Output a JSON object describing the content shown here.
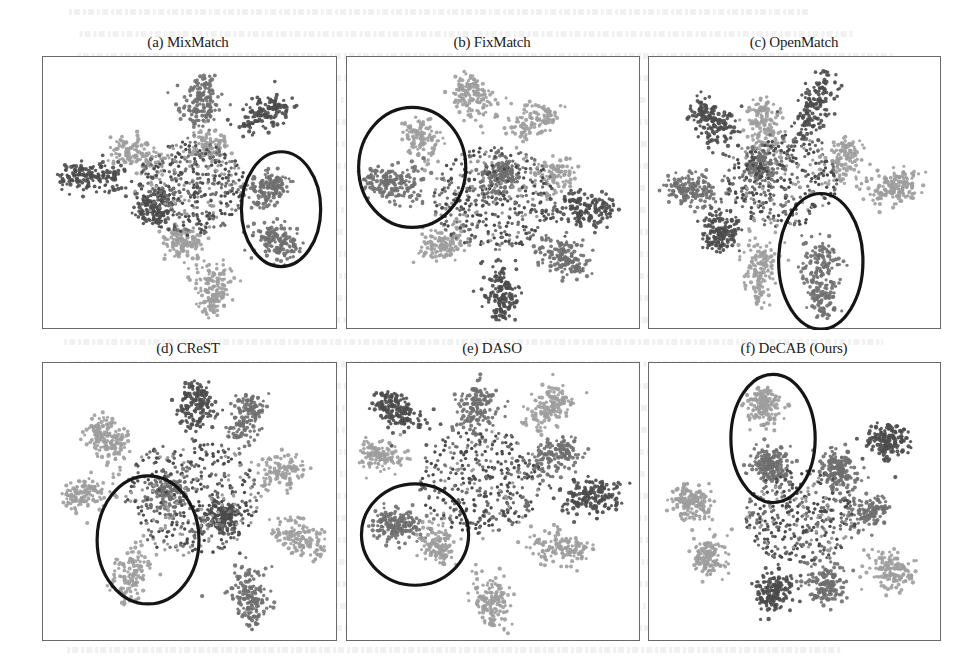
{
  "chart_data": [
    {
      "type": "scatter",
      "title": "(a) MixMatch",
      "xlabel": "",
      "ylabel": "",
      "grid": false,
      "legend": "none",
      "xlim": [
        0,
        1
      ],
      "ylim": [
        0,
        1
      ],
      "clusters": [
        {
          "tone": "dark",
          "arm": [
            0.05,
            0.43
          ],
          "center": [
            0.25,
            0.44
          ],
          "n": 160
        },
        {
          "tone": "mid",
          "arm": [
            0.55,
            0.08
          ],
          "center": [
            0.52,
            0.22
          ],
          "n": 150
        },
        {
          "tone": "dark",
          "arm": [
            0.82,
            0.17
          ],
          "center": [
            0.7,
            0.22
          ],
          "n": 130
        },
        {
          "tone": "light",
          "arm": [
            0.25,
            0.33
          ],
          "center": [
            0.38,
            0.38
          ],
          "n": 130
        },
        {
          "tone": "light",
          "arm": [
            0.58,
            0.3
          ],
          "center": [
            0.55,
            0.35
          ],
          "n": 110
        },
        {
          "tone": "mid",
          "arm": [
            0.8,
            0.46
          ],
          "center": [
            0.75,
            0.5
          ],
          "n": 150
        },
        {
          "tone": "mid",
          "arm": [
            0.85,
            0.7
          ],
          "center": [
            0.76,
            0.66
          ],
          "n": 140
        },
        {
          "tone": "light",
          "arm": [
            0.58,
            0.93
          ],
          "center": [
            0.58,
            0.8
          ],
          "n": 150
        },
        {
          "tone": "light",
          "arm": [
            0.45,
            0.67
          ],
          "center": [
            0.5,
            0.7
          ],
          "n": 130
        },
        {
          "tone": "dark",
          "arm": [
            0.35,
            0.58
          ],
          "center": [
            0.4,
            0.52
          ],
          "n": 140
        }
      ],
      "core": {
        "center": [
          0.5,
          0.48
        ],
        "radius": 0.18,
        "n": 420
      },
      "highlight": {
        "shape": "ellipse",
        "center": [
          0.82,
          0.56
        ],
        "radii": [
          0.14,
          0.22
        ]
      }
    },
    {
      "type": "scatter",
      "title": "(b) FixMatch",
      "xlabel": "",
      "ylabel": "",
      "grid": false,
      "legend": "none",
      "xlim": [
        0,
        1
      ],
      "ylim": [
        0,
        1
      ],
      "clusters": [
        {
          "tone": "light",
          "arm": [
            0.4,
            0.08
          ],
          "center": [
            0.45,
            0.18
          ],
          "n": 140
        },
        {
          "tone": "light",
          "arm": [
            0.7,
            0.2
          ],
          "center": [
            0.58,
            0.25
          ],
          "n": 110
        },
        {
          "tone": "light",
          "arm": [
            0.2,
            0.24
          ],
          "center": [
            0.28,
            0.33
          ],
          "n": 110
        },
        {
          "tone": "mid",
          "arm": [
            0.06,
            0.45
          ],
          "center": [
            0.22,
            0.47
          ],
          "n": 170
        },
        {
          "tone": "mid",
          "arm": [
            0.52,
            0.4
          ],
          "center": [
            0.52,
            0.47
          ],
          "n": 150
        },
        {
          "tone": "light",
          "arm": [
            0.76,
            0.4
          ],
          "center": [
            0.66,
            0.45
          ],
          "n": 100
        },
        {
          "tone": "dark",
          "arm": [
            0.9,
            0.56
          ],
          "center": [
            0.75,
            0.57
          ],
          "n": 150
        },
        {
          "tone": "mid",
          "arm": [
            0.8,
            0.8
          ],
          "center": [
            0.7,
            0.7
          ],
          "n": 150
        },
        {
          "tone": "dark",
          "arm": [
            0.52,
            0.97
          ],
          "center": [
            0.53,
            0.8
          ],
          "n": 160
        },
        {
          "tone": "light",
          "arm": [
            0.28,
            0.72
          ],
          "center": [
            0.35,
            0.68
          ],
          "n": 120
        }
      ],
      "core": {
        "center": [
          0.5,
          0.52
        ],
        "radius": 0.2,
        "n": 420
      },
      "highlight": {
        "shape": "ellipse",
        "center": [
          0.21,
          0.4
        ],
        "radii": [
          0.19,
          0.23
        ]
      }
    },
    {
      "type": "scatter",
      "title": "(c) OpenMatch",
      "xlabel": "",
      "ylabel": "",
      "grid": false,
      "legend": "none",
      "xlim": [
        0,
        1
      ],
      "ylim": [
        0,
        1
      ],
      "clusters": [
        {
          "tone": "dark",
          "arm": [
            0.15,
            0.17
          ],
          "center": [
            0.25,
            0.28
          ],
          "n": 160
        },
        {
          "tone": "light",
          "arm": [
            0.38,
            0.16
          ],
          "center": [
            0.4,
            0.3
          ],
          "n": 140
        },
        {
          "tone": "dark",
          "arm": [
            0.6,
            0.06
          ],
          "center": [
            0.54,
            0.25
          ],
          "n": 150
        },
        {
          "tone": "light",
          "arm": [
            0.7,
            0.32
          ],
          "center": [
            0.66,
            0.42
          ],
          "n": 110
        },
        {
          "tone": "light",
          "arm": [
            0.9,
            0.47
          ],
          "center": [
            0.8,
            0.48
          ],
          "n": 150
        },
        {
          "tone": "mid",
          "arm": [
            0.06,
            0.48
          ],
          "center": [
            0.2,
            0.48
          ],
          "n": 160
        },
        {
          "tone": "dark",
          "arm": [
            0.2,
            0.7
          ],
          "center": [
            0.26,
            0.6
          ],
          "n": 150
        },
        {
          "tone": "light",
          "arm": [
            0.37,
            0.9
          ],
          "center": [
            0.38,
            0.7
          ],
          "n": 140
        },
        {
          "tone": "mid",
          "arm": [
            0.6,
            0.95
          ],
          "center": [
            0.58,
            0.7
          ],
          "n": 200
        },
        {
          "tone": "mid",
          "arm": [
            0.35,
            0.38
          ],
          "center": [
            0.4,
            0.42
          ],
          "n": 120
        }
      ],
      "core": {
        "center": [
          0.45,
          0.45
        ],
        "radius": 0.18,
        "n": 380
      },
      "highlight": {
        "shape": "ellipse",
        "center": [
          0.59,
          0.76
        ],
        "radii": [
          0.15,
          0.26
        ]
      }
    },
    {
      "type": "scatter",
      "title": "(d) CReST",
      "xlabel": "",
      "ylabel": "",
      "grid": false,
      "legend": "none",
      "xlim": [
        0,
        1
      ],
      "ylim": [
        0,
        1
      ],
      "clusters": [
        {
          "tone": "light",
          "arm": [
            0.18,
            0.22
          ],
          "center": [
            0.24,
            0.3
          ],
          "n": 160
        },
        {
          "tone": "light",
          "arm": [
            0.08,
            0.48
          ],
          "center": [
            0.18,
            0.45
          ],
          "n": 120
        },
        {
          "tone": "dark",
          "arm": [
            0.52,
            0.08
          ],
          "center": [
            0.52,
            0.2
          ],
          "n": 150
        },
        {
          "tone": "mid",
          "arm": [
            0.72,
            0.12
          ],
          "center": [
            0.68,
            0.24
          ],
          "n": 140
        },
        {
          "tone": "light",
          "arm": [
            0.88,
            0.36
          ],
          "center": [
            0.78,
            0.4
          ],
          "n": 110
        },
        {
          "tone": "mid",
          "arm": [
            0.42,
            0.45
          ],
          "center": [
            0.42,
            0.48
          ],
          "n": 140
        },
        {
          "tone": "dark",
          "arm": [
            0.6,
            0.55
          ],
          "center": [
            0.62,
            0.55
          ],
          "n": 160
        },
        {
          "tone": "light",
          "arm": [
            0.95,
            0.65
          ],
          "center": [
            0.82,
            0.62
          ],
          "n": 130
        },
        {
          "tone": "mid",
          "arm": [
            0.72,
            0.93
          ],
          "center": [
            0.7,
            0.78
          ],
          "n": 160
        },
        {
          "tone": "light",
          "arm": [
            0.26,
            0.84
          ],
          "center": [
            0.32,
            0.7
          ],
          "n": 130
        }
      ],
      "core": {
        "center": [
          0.5,
          0.48
        ],
        "radius": 0.22,
        "n": 420
      },
      "highlight": {
        "shape": "ellipse",
        "center": [
          0.35,
          0.64
        ],
        "radii": [
          0.18,
          0.24
        ]
      }
    },
    {
      "type": "scatter",
      "title": "(e) DASO",
      "xlabel": "",
      "ylabel": "",
      "grid": false,
      "legend": "none",
      "xlim": [
        0,
        1
      ],
      "ylim": [
        0,
        1
      ],
      "clusters": [
        {
          "tone": "dark",
          "arm": [
            0.1,
            0.12
          ],
          "center": [
            0.22,
            0.2
          ],
          "n": 160
        },
        {
          "tone": "mid",
          "arm": [
            0.45,
            0.08
          ],
          "center": [
            0.43,
            0.2
          ],
          "n": 150
        },
        {
          "tone": "light",
          "arm": [
            0.75,
            0.1
          ],
          "center": [
            0.65,
            0.18
          ],
          "n": 140
        },
        {
          "tone": "light",
          "arm": [
            0.06,
            0.32
          ],
          "center": [
            0.14,
            0.33
          ],
          "n": 120
        },
        {
          "tone": "mid",
          "arm": [
            0.78,
            0.3
          ],
          "center": [
            0.67,
            0.35
          ],
          "n": 140
        },
        {
          "tone": "dark",
          "arm": [
            0.92,
            0.48
          ],
          "center": [
            0.78,
            0.48
          ],
          "n": 160
        },
        {
          "tone": "mid",
          "arm": [
            0.1,
            0.58
          ],
          "center": [
            0.22,
            0.58
          ],
          "n": 180
        },
        {
          "tone": "light",
          "arm": [
            0.3,
            0.7
          ],
          "center": [
            0.3,
            0.62
          ],
          "n": 120
        },
        {
          "tone": "light",
          "arm": [
            0.82,
            0.68
          ],
          "center": [
            0.66,
            0.66
          ],
          "n": 140
        },
        {
          "tone": "light",
          "arm": [
            0.5,
            0.94
          ],
          "center": [
            0.48,
            0.8
          ],
          "n": 150
        }
      ],
      "core": {
        "center": [
          0.45,
          0.42
        ],
        "radius": 0.2,
        "n": 380
      },
      "highlight": {
        "shape": "ellipse",
        "center": [
          0.22,
          0.62
        ],
        "radii": [
          0.19,
          0.19
        ]
      }
    },
    {
      "type": "scatter",
      "title": "(f) DeCAB (Ours)",
      "xlabel": "",
      "ylabel": "",
      "grid": false,
      "legend": "none",
      "xlim": [
        0,
        1
      ],
      "ylim": [
        0,
        1
      ],
      "clusters": [
        {
          "tone": "light",
          "arm": [
            0.38,
            0.1
          ],
          "center": [
            0.4,
            0.16
          ],
          "n": 150
        },
        {
          "tone": "mid",
          "arm": [
            0.4,
            0.36
          ],
          "center": [
            0.42,
            0.36
          ],
          "n": 180
        },
        {
          "tone": "dark",
          "arm": [
            0.86,
            0.26
          ],
          "center": [
            0.8,
            0.28
          ],
          "n": 150
        },
        {
          "tone": "mid",
          "arm": [
            0.64,
            0.34
          ],
          "center": [
            0.66,
            0.42
          ],
          "n": 170
        },
        {
          "tone": "light",
          "arm": [
            0.1,
            0.48
          ],
          "center": [
            0.16,
            0.52
          ],
          "n": 160
        },
        {
          "tone": "light",
          "arm": [
            0.18,
            0.73
          ],
          "center": [
            0.2,
            0.68
          ],
          "n": 130
        },
        {
          "tone": "light",
          "arm": [
            0.88,
            0.78
          ],
          "center": [
            0.8,
            0.72
          ],
          "n": 130
        },
        {
          "tone": "dark",
          "arm": [
            0.4,
            0.88
          ],
          "center": [
            0.45,
            0.78
          ],
          "n": 160
        },
        {
          "tone": "mid",
          "arm": [
            0.62,
            0.86
          ],
          "center": [
            0.6,
            0.76
          ],
          "n": 150
        },
        {
          "tone": "mid",
          "arm": [
            0.8,
            0.52
          ],
          "center": [
            0.72,
            0.55
          ],
          "n": 120
        }
      ],
      "core": {
        "center": [
          0.52,
          0.55
        ],
        "radius": 0.18,
        "n": 360
      },
      "highlight": {
        "shape": "ellipse",
        "center": [
          0.42,
          0.26
        ],
        "radii": [
          0.15,
          0.24
        ]
      }
    }
  ],
  "tones": {
    "dark": "#4b4b4b",
    "mid": "#6f6f6f",
    "light": "#9d9d9d",
    "highlight_stroke": "#151515",
    "border": "#6a6a6a"
  }
}
